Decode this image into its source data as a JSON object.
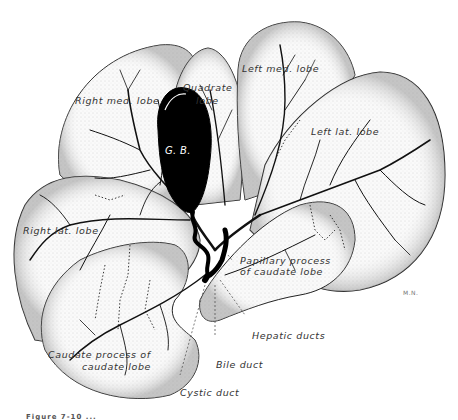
{
  "figure": {
    "type": "anatomical-illustration",
    "artist_signature": "M.N.",
    "caption_partial": "Figure 7-10 ..."
  },
  "labels": {
    "right_med_lobe": "Right med. lobe",
    "quadrate_lobe_line1": "Quadrate",
    "quadrate_lobe_line2": "lobe",
    "left_med_lobe": "Left med. lobe",
    "left_lat_lobe": "Left lat. lobe",
    "gall_bladder": "G. B.",
    "right_lat_lobe": "Right lat. lobe",
    "papillary_process_line1": "Papillary process",
    "papillary_process_line2": "of caudate lobe",
    "hepatic_ducts": "Hepatic ducts",
    "caudate_process_line1": "Caudate process of",
    "caudate_process_line2": "caudate lobe",
    "bile_duct": "Bile duct",
    "cystic_duct": "Cystic duct"
  },
  "colors": {
    "outline": "#1a1a1a",
    "lobe_fill": "#f4f4f4",
    "stipple": "#9a9a9a",
    "gall_bladder": "#000000",
    "label_text": "#333333"
  }
}
